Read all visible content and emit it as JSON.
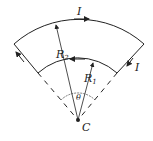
{
  "diagram": {
    "type": "circular sector current loop",
    "labels": {
      "current_top": "I",
      "current_right": "I",
      "outer_radius": "R",
      "outer_radius_sub": "2",
      "inner_radius": "R",
      "inner_radius_sub": "1",
      "angle": "θ",
      "center": "C"
    },
    "colors": {
      "stroke": "#222222",
      "background": "#ffffff"
    }
  }
}
